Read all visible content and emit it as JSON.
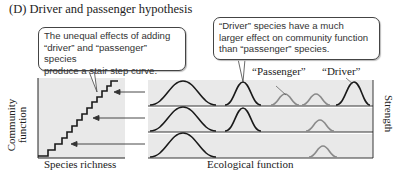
{
  "title": "(D)  Driver and passenger hypothesis",
  "callouts": {
    "left": {
      "line1": "The unequal effects of adding",
      "line2": "“driver” and “passenger” species",
      "line3": "produce a stair step curve."
    },
    "right": {
      "line1": "“Driver” species have a much",
      "line2": "larger effect on community function",
      "line3": "than “passenger” species."
    }
  },
  "labels": {
    "passenger": "“Passenger”",
    "driver": "“Driver”",
    "y_axis_left_line1": "Community",
    "y_axis_left_line2": "function",
    "x_axis_left": "Species richness",
    "x_axis_right": "Ecological function",
    "y_axis_right": "Strength"
  },
  "colors": {
    "panel_bg": "#e9e9e9",
    "driver_curve": "#1a1a1a",
    "passenger_curve": "#8a8a8a",
    "axis": "#222222"
  },
  "rows": [
    {
      "curves": [
        "large-driver",
        "driver",
        "passenger",
        "passenger",
        "driver"
      ]
    },
    {
      "curves": [
        "large-driver",
        "driver",
        "passenger"
      ]
    },
    {
      "curves": [
        "large-driver",
        "passenger"
      ]
    }
  ]
}
